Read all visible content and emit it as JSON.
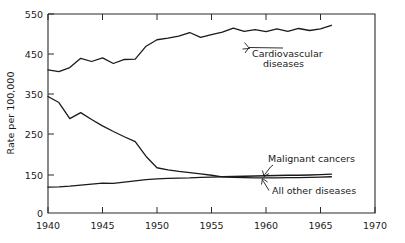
{
  "chart_data": {
    "type": "line",
    "title": "",
    "subtitle": "",
    "xlabel": "",
    "ylabel": "Rate per 100,000",
    "xlim": [
      1940,
      1970
    ],
    "ylim": [
      0,
      550
    ],
    "grid": false,
    "legend_position": "inline-annotations",
    "y_axis_note": "axis compressed between 0 and 150",
    "xticks": [
      "1940",
      "1945",
      "1950",
      "1955",
      "1960",
      "1965",
      "1970"
    ],
    "xtick_values": [
      1940,
      1945,
      1950,
      1955,
      1960,
      1965,
      1970
    ],
    "yticks": [
      "0",
      "150",
      "250",
      "350",
      "450",
      "550"
    ],
    "ytick_values": [
      0,
      150,
      250,
      350,
      450,
      550
    ],
    "series": [
      {
        "name": "Cardiovascular diseases",
        "label_line1": "Cardiovascular",
        "label_line2": "diseases",
        "color": "#1a1a1a",
        "x": [
          1940,
          1941,
          1942,
          1943,
          1944,
          1945,
          1946,
          1947,
          1948,
          1949,
          1950,
          1951,
          1952,
          1953,
          1954,
          1955,
          1956,
          1957,
          1958,
          1959,
          1960,
          1961,
          1962,
          1963,
          1964,
          1965,
          1966
        ],
        "values": [
          411,
          407,
          417,
          440,
          432,
          441,
          427,
          437,
          438,
          470,
          486,
          490,
          495,
          504,
          492,
          499,
          505,
          515,
          507,
          511,
          506,
          513,
          507,
          514,
          509,
          513,
          522
        ]
      },
      {
        "name": "All other diseases",
        "label_line1": "All other diseases",
        "label_line2": "",
        "color": "#1a1a1a",
        "x": [
          1940,
          1941,
          1942,
          1943,
          1944,
          1945,
          1946,
          1947,
          1948,
          1949,
          1950,
          1951,
          1952,
          1953,
          1954,
          1955,
          1956,
          1957,
          1958,
          1959,
          1960,
          1961,
          1962,
          1963,
          1964,
          1965,
          1966
        ],
        "values": [
          345,
          330,
          290,
          305,
          288,
          272,
          258,
          245,
          233,
          196,
          168,
          163,
          159,
          156,
          153,
          149,
          143,
          141,
          140,
          139,
          139,
          139,
          140,
          140,
          141,
          142,
          143
        ]
      },
      {
        "name": "Malignant cancers",
        "label_line1": "Malignant cancers",
        "label_line2": "",
        "color": "#1a1a1a",
        "x": [
          1940,
          1941,
          1942,
          1943,
          1944,
          1945,
          1946,
          1947,
          1948,
          1949,
          1950,
          1951,
          1952,
          1953,
          1954,
          1955,
          1956,
          1957,
          1958,
          1959,
          1960,
          1961,
          1962,
          1963,
          1964,
          1965,
          1966
        ],
        "values": [
          102,
          103,
          106,
          110,
          114,
          118,
          117,
          122,
          127,
          132,
          135,
          137,
          138,
          139,
          141,
          142,
          143,
          144,
          145,
          146,
          147,
          148,
          149,
          149,
          150,
          151,
          152
        ]
      }
    ],
    "annotations": [
      {
        "name": "cardiovascular-annotation",
        "text_line1": "Cardiovascular",
        "text_line2": "diseases",
        "points_to_year": 1957
      },
      {
        "name": "malignant-cancers-annotation",
        "text_line1": "Malignant cancers",
        "text_line2": "",
        "points_to_year": 1958.5
      },
      {
        "name": "all-other-diseases-annotation",
        "text_line1": "All other diseases",
        "text_line2": "",
        "points_to_year": 1959.5
      }
    ]
  }
}
